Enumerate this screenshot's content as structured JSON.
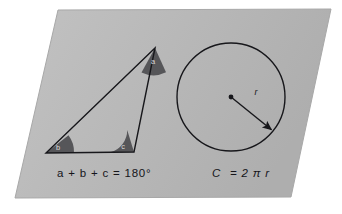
{
  "figure": {
    "title_semantic": "geometry-formulas-diagram",
    "card": {
      "shape": "parallelogram",
      "fill_color": "#b8b8b8",
      "corners": [
        [
          58,
          10
        ],
        [
          331,
          9
        ],
        [
          291,
          197
        ],
        [
          15,
          198
        ]
      ]
    },
    "triangle": {
      "stroke_color": "#17171b",
      "vertices": [
        [
          155,
          48
        ],
        [
          46,
          153
        ],
        [
          134,
          152
        ]
      ],
      "angles": [
        {
          "name": "angle-a",
          "label": "a",
          "vertex": [
            155,
            48
          ],
          "wedge_fill": "#565659"
        },
        {
          "name": "angle-b",
          "label": "b",
          "vertex": [
            46,
            153
          ],
          "wedge_fill": "#565659"
        },
        {
          "name": "angle-c",
          "label": "c",
          "vertex": [
            134,
            152
          ],
          "wedge_fill": "#565659"
        }
      ],
      "formula": "a + b + c = 180°"
    },
    "circle": {
      "stroke_color": "#17171b",
      "center": [
        231,
        97
      ],
      "radius": 54,
      "center_dot_label": "center-point",
      "radius_arrow": {
        "from": [
          231,
          97
        ],
        "to": [
          273,
          131
        ],
        "label": "r"
      },
      "formula_parts": {
        "left": "C",
        "equals": "= 2",
        "pi": "π",
        "r": "r"
      },
      "formula": "C = 2πr"
    }
  }
}
